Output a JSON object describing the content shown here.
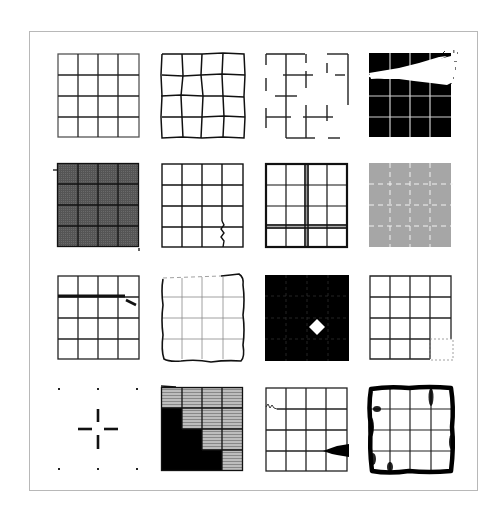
{
  "figure": {
    "rows": 4,
    "cols": 4,
    "grid_cells": 4,
    "colors": {
      "line": "#1a1a1a",
      "frame": "#b8b8b8",
      "gray_fill": "#a8a8a8",
      "dark_fill": "#555555",
      "black": "#000000",
      "white": "#ffffff"
    },
    "panels": [
      {
        "id": "r1c1",
        "label": "clean grid, faded top-left edges"
      },
      {
        "id": "r1c2",
        "label": "warped / jittered grid"
      },
      {
        "id": "r1c3",
        "label": "broken grid with missing segments"
      },
      {
        "id": "r1c4",
        "label": "inverted grid with white streak erasure"
      },
      {
        "id": "r2c1",
        "label": "dark gray textured fill grid"
      },
      {
        "id": "r2c2",
        "label": "grid with wavy crack line"
      },
      {
        "id": "r2c3",
        "label": "grid with doubled shaded lines"
      },
      {
        "id": "r2c4",
        "label": "gray fill with dashed white lines"
      },
      {
        "id": "r3c1",
        "label": "grid with thick misaligned stroke"
      },
      {
        "id": "r3c2",
        "label": "hand-drawn wobbly border, faint lines"
      },
      {
        "id": "r3c3",
        "label": "black fill with white diamond"
      },
      {
        "id": "r3c4",
        "label": "grid with dashed missing corner cell"
      },
      {
        "id": "r4c1",
        "label": "sparse dots and center crosshair"
      },
      {
        "id": "r4c2",
        "label": "staircase black fill over striped cells"
      },
      {
        "id": "r4c3",
        "label": "grid with squiggle and ink smear"
      },
      {
        "id": "r4c4",
        "label": "grid with smudged ink border"
      }
    ]
  }
}
